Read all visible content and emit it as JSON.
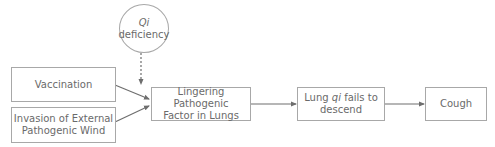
{
  "diagram": {
    "nodes": {
      "qi_deficiency": {
        "line1": "Qi",
        "line2": "deficiency",
        "shape": "ellipse"
      },
      "vaccination": {
        "label": "Vaccination",
        "shape": "rect"
      },
      "invasion": {
        "line1": "Invasion of External",
        "line2": "Pathogenic Wind",
        "shape": "rect"
      },
      "lingering": {
        "line1": "Lingering Pathogenic",
        "line2": "Factor in Lungs",
        "shape": "rect"
      },
      "lung_qi": {
        "pre": "Lung ",
        "italic": "qi",
        "post": " fails to",
        "line2": "descend",
        "shape": "rect"
      },
      "cough": {
        "label": "Cough",
        "shape": "rect"
      }
    },
    "edges": [
      {
        "from": "qi_deficiency",
        "to": "lingering",
        "style": "dashed"
      },
      {
        "from": "vaccination",
        "to": "lingering",
        "style": "solid"
      },
      {
        "from": "invasion",
        "to": "lingering",
        "style": "solid"
      },
      {
        "from": "lingering",
        "to": "lung_qi",
        "style": "solid"
      },
      {
        "from": "lung_qi",
        "to": "cough",
        "style": "solid"
      }
    ],
    "colors": {
      "border": "#a8a8a8",
      "text": "#6a6a6a",
      "arrow": "#6e6e6e"
    }
  }
}
